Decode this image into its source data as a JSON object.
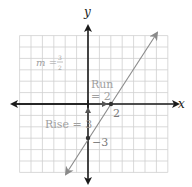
{
  "diagram": {
    "type": "coordinate-plane-line",
    "axes": {
      "x_label": "x",
      "y_label": "y",
      "x_range": [
        -6,
        7
      ],
      "y_range": [
        -6,
        6
      ],
      "grid_step": 1
    },
    "line": {
      "slope_numerator": "3",
      "slope_denominator": "2",
      "y_intercept": -3,
      "x_intercept": 2
    },
    "labels": {
      "slope_m": "m =",
      "slope_num": "3",
      "slope_den": "2",
      "run_line1": "Run",
      "run_line2": "= 2",
      "rise": "Rise = 3",
      "x_intercept_label": "2",
      "y_intercept_label": "−3"
    },
    "points": [
      {
        "name": "x-intercept",
        "x": 2,
        "y": 0
      },
      {
        "name": "y-intercept",
        "x": 0,
        "y": -3
      }
    ],
    "colors": {
      "axis": "#1a1a1a",
      "grid": "#cfcfcf",
      "line": "#8a8a8a",
      "label": "#a0a0a0"
    }
  }
}
